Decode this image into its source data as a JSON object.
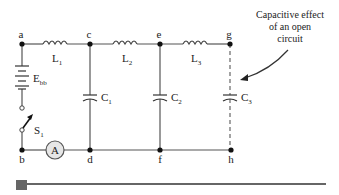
{
  "diagram": {
    "nodes": {
      "a": "a",
      "b": "b",
      "c": "c",
      "d": "d",
      "e": "e",
      "f": "f",
      "g": "g",
      "h": "h"
    },
    "components": {
      "L1": {
        "name": "L",
        "sub": "1"
      },
      "L2": {
        "name": "L",
        "sub": "2"
      },
      "L3": {
        "name": "L",
        "sub": "3"
      },
      "C1": {
        "name": "C",
        "sub": "1"
      },
      "C2": {
        "name": "C",
        "sub": "2"
      },
      "C3": {
        "name": "C",
        "sub": "3"
      },
      "Ebb": {
        "name": "E",
        "sub": "bb"
      },
      "S1": {
        "name": "S",
        "sub": "1"
      },
      "ammeter": "A"
    },
    "annotation": {
      "line1": "Capacitive effect",
      "line2": "of an open",
      "line3": "circuit"
    },
    "colors": {
      "wire": "#555555",
      "node": "#111111",
      "ammeter_fill": "#e6e6e6",
      "progress": "#666666"
    }
  },
  "progress_bar": {
    "position_percent": 0
  }
}
